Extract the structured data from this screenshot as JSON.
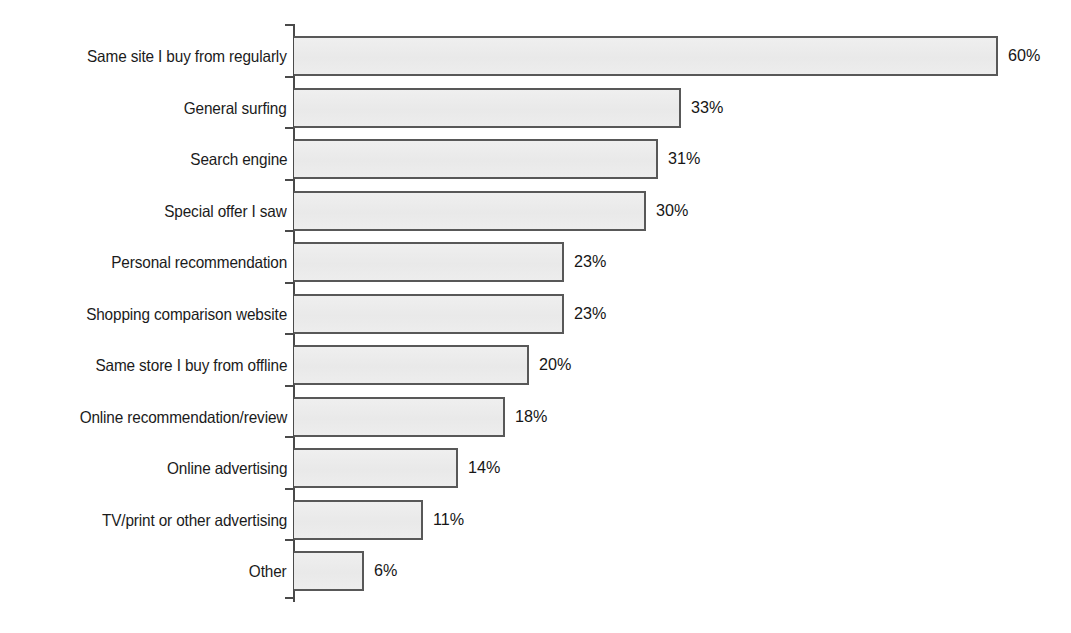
{
  "chart_data": {
    "type": "bar",
    "orientation": "horizontal",
    "title": "",
    "subtitle": "",
    "xlabel": "",
    "ylabel": "",
    "xlim": [
      0,
      60
    ],
    "grid": false,
    "legend": null,
    "value_suffix": "%",
    "categories": [
      "Same site I buy from regularly",
      "General surfing",
      "Search engine",
      "Special offer I saw",
      "Personal recommendation",
      "Shopping comparison website",
      "Same store I buy from offline",
      "Online recommendation/review",
      "Online advertising",
      "TV/print or other advertising",
      "Other"
    ],
    "values": [
      60,
      33,
      31,
      30,
      23,
      23,
      20,
      18,
      14,
      11,
      6
    ],
    "value_labels": [
      "60%",
      "33%",
      "31%",
      "30%",
      "23%",
      "23%",
      "20%",
      "18%",
      "14%",
      "11%",
      "6%"
    ],
    "tick_labels": [],
    "colors": {
      "bar_fill": "#ececec",
      "bar_border": "#585858",
      "axis": "#4a4a4a",
      "text": "#1a1a1a",
      "background": "#ffffff"
    }
  }
}
